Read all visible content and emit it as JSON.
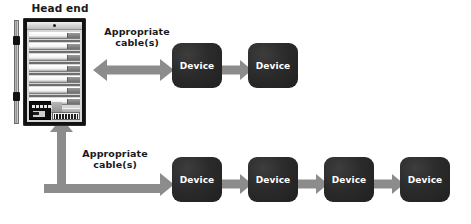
{
  "diagram": {
    "title_label": "Head end",
    "background_color": "#ffffff",
    "arrow_color": "#8c8c8c",
    "device_color": "#262626",
    "text_color": "#1a1a1a",
    "labels": {
      "head_end": "Head end",
      "cable_top": "Appropriate\ncable(s)",
      "cable_bottom": "Appropriate\ncable(s)"
    },
    "top_row": {
      "devices": [
        {
          "label": "Device",
          "x": 172,
          "y": 43
        },
        {
          "label": "Device",
          "x": 248,
          "y": 43
        }
      ],
      "connector_type": "double-headed-arrow"
    },
    "bottom_row": {
      "devices": [
        {
          "label": "Device",
          "x": 172,
          "y": 157
        },
        {
          "label": "Device",
          "x": 248,
          "y": 157
        },
        {
          "label": "Device",
          "x": 324,
          "y": 157
        },
        {
          "label": "Device",
          "x": 400,
          "y": 157
        }
      ],
      "connector_type": "elbow-arrow"
    },
    "head_end_rack": {
      "slot_count": 7,
      "led_count": 5,
      "port_count": 16,
      "has_top_indicator": true,
      "has_hinges": true
    }
  }
}
